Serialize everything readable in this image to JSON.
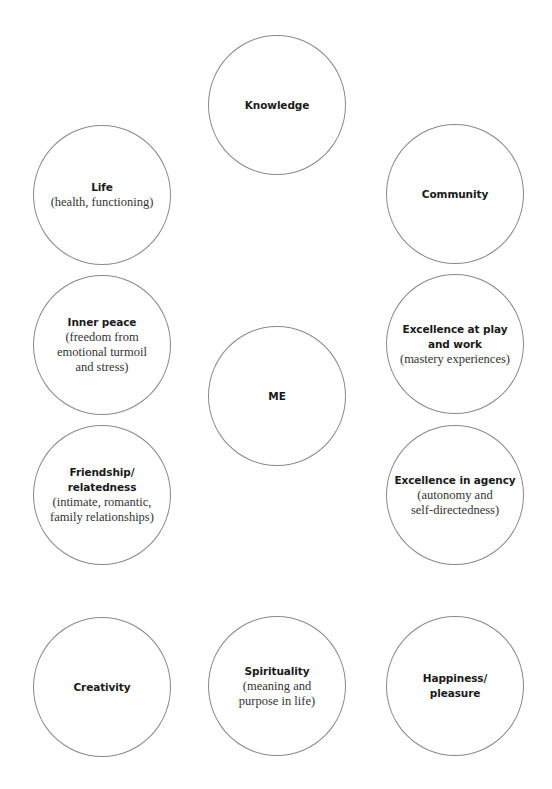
{
  "diagram": {
    "type": "concept-map",
    "center": {
      "title": "ME",
      "subtitle": ""
    },
    "nodes": [
      {
        "id": "knowledge",
        "title": "Knowledge",
        "subtitle": ""
      },
      {
        "id": "life",
        "title": "Life",
        "subtitle": "(health, functioning)"
      },
      {
        "id": "community",
        "title": "Community",
        "subtitle": ""
      },
      {
        "id": "inner-peace",
        "title": "Inner peace",
        "subtitle": "(freedom from\nemotional turmoil\nand stress)"
      },
      {
        "id": "excellence-play-work",
        "title": "Excellence at play\nand work",
        "subtitle": "(mastery experiences)"
      },
      {
        "id": "friendship",
        "title": "Friendship/\nrelatedness",
        "subtitle": "(intimate, romantic,\nfamily relationships)"
      },
      {
        "id": "excellence-agency",
        "title": "Excellence in agency",
        "subtitle": "(autonomy and\nself-directedness)"
      },
      {
        "id": "creativity",
        "title": "Creativity",
        "subtitle": ""
      },
      {
        "id": "spirituality",
        "title": "Spirituality",
        "subtitle": "(meaning and\npurpose in life)"
      },
      {
        "id": "happiness",
        "title": "Happiness/\npleasure",
        "subtitle": ""
      }
    ],
    "colors": {
      "circle_stroke": "#8a8a8a",
      "title_text": "#1a1a1a",
      "subtitle_text": "#333333",
      "background": "#ffffff"
    }
  }
}
